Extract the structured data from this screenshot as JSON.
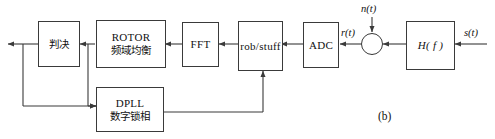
{
  "figure": {
    "caption": "(b)",
    "type": "block-diagram",
    "line_color": "#3a3a3a",
    "text_color": "#111111",
    "background": "#ffffff"
  },
  "blocks": [
    {
      "id": "decision",
      "label_cjk": "判决",
      "label_latin": ""
    },
    {
      "id": "rotor",
      "label_latin": "ROTOR",
      "label_cjk": "频域均衡"
    },
    {
      "id": "fft",
      "label_latin": "FFT",
      "label_cjk": ""
    },
    {
      "id": "robstuff",
      "label_latin": "rob/stuff",
      "label_cjk": ""
    },
    {
      "id": "adc",
      "label_latin": "ADC",
      "label_cjk": ""
    },
    {
      "id": "channel",
      "label_latin": "H( f )",
      "label_cjk": ""
    },
    {
      "id": "dpll",
      "label_latin": "DPLL",
      "label_cjk": "数字锁相"
    }
  ],
  "adder": {
    "id": "summing-junction",
    "symbol": "quadrant-cross"
  },
  "signals": [
    {
      "id": "noise",
      "label": "n(t)"
    },
    {
      "id": "received",
      "label": "r(t)"
    },
    {
      "id": "source",
      "label": "s(t)"
    }
  ]
}
